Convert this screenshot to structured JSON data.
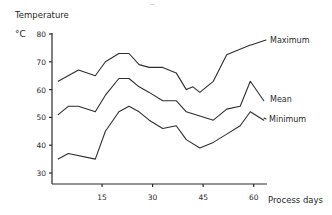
{
  "page": {
    "header_fragment": "..."
  },
  "chart_data": {
    "type": "line",
    "title": "",
    "ylabel": "Temperature",
    "yunit": "°C",
    "xlabel": "Process days",
    "xlim": [
      0,
      64
    ],
    "ylim": [
      27,
      80
    ],
    "grid": false,
    "legend_position": "inline-right",
    "yticks": [
      30,
      40,
      50,
      60,
      70,
      80
    ],
    "xticks": [
      15,
      30,
      45,
      60
    ],
    "ytick_labels": [
      "30",
      "40",
      "50",
      "60",
      "70",
      "80"
    ],
    "xtick_labels": [
      "15",
      "30",
      "45",
      "60"
    ],
    "series": [
      {
        "name": "Maximum",
        "label": "Maximum",
        "x": [
          2,
          8,
          13,
          16,
          20,
          23,
          26,
          29,
          33,
          37,
          40,
          42,
          44,
          48,
          52,
          59
        ],
        "values": [
          63,
          67,
          65,
          70,
          73,
          73,
          69,
          68,
          68,
          66,
          60,
          61,
          59,
          63,
          72.5,
          76
        ]
      },
      {
        "name": "Mean",
        "label": "Mean",
        "x": [
          2,
          5,
          8,
          13,
          16,
          20,
          23,
          26,
          29,
          33,
          37,
          40,
          48,
          52,
          56,
          59,
          63
        ],
        "values": [
          51,
          54,
          54,
          52,
          58,
          64,
          64,
          61,
          59,
          56,
          56,
          52,
          49,
          53,
          54,
          63,
          56
        ]
      },
      {
        "name": "Minimum",
        "label": "Minimum",
        "x": [
          2,
          5,
          13,
          16,
          20,
          23,
          26,
          29,
          33,
          37,
          40,
          44,
          48,
          52,
          56,
          59,
          63
        ],
        "values": [
          35,
          37,
          35,
          45,
          52,
          54,
          52,
          49,
          46,
          47,
          42,
          39,
          41,
          44,
          47,
          52,
          49
        ]
      }
    ]
  }
}
